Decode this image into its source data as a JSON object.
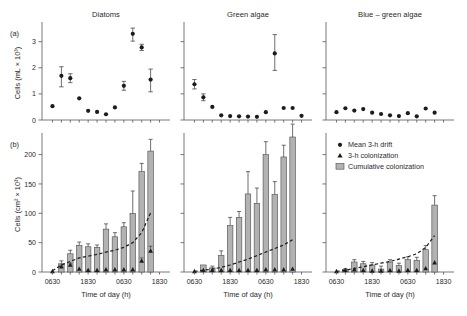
{
  "figure": {
    "panel_a_label": "(a)",
    "panel_b_label": "(b)",
    "xlabel": "Time of day (h)",
    "ylabel_a": "Cells (mL × 10³)",
    "ylabel_b": "Cells (cm² × 10³)",
    "xticklabels": [
      "0630",
      "1830",
      "0630",
      "1830"
    ],
    "yticklabels_a": [
      "0",
      "1",
      "2",
      "3"
    ],
    "yticklabels_b": [
      "0",
      "50",
      "100",
      "150",
      "200"
    ],
    "panel_titles": [
      "Diatoms",
      "Green algae",
      "Blue – green algae"
    ],
    "colors": {
      "bar_fill": "#b2b2b2",
      "bar_stroke": "#4a4a4a",
      "marker": "#1c1c1c",
      "axis": "#555555",
      "background": "#ffffff"
    }
  },
  "legend": {
    "items": [
      {
        "marker": "circle",
        "label": "Mean 3-h drift"
      },
      {
        "marker": "triangle",
        "label": "3-h colonization"
      },
      {
        "marker": "bar",
        "label": "Cumulative colonization"
      }
    ]
  },
  "chart_data": [
    {
      "type": "scatter",
      "panel": "a",
      "title": "Diatoms",
      "xlabel": "",
      "ylabel": "Cells (mL × 10³)",
      "ylim": [
        0,
        3.6
      ],
      "yticks": [
        0,
        1,
        2,
        3
      ],
      "xticks": [
        1,
        5,
        9,
        13
      ],
      "xticklabels": [
        "0630",
        "1830",
        "0630",
        "1830"
      ],
      "grid": false,
      "series": [
        {
          "name": "Mean 3-h drift",
          "x": [
            1,
            2,
            3,
            4,
            5,
            6,
            7,
            8,
            9,
            10,
            11,
            12,
            13
          ],
          "values": [
            0.53,
            1.69,
            1.6,
            0.83,
            0.35,
            0.31,
            0.22,
            0.48,
            1.31,
            3.3,
            2.78,
            1.55,
            null
          ],
          "err_low": [
            0.0,
            0.42,
            0.17,
            0.0,
            0.0,
            0.0,
            0.0,
            0.0,
            0.17,
            0.28,
            0.12,
            0.47,
            null
          ],
          "err_high": [
            0.0,
            0.35,
            0.17,
            0.0,
            0.0,
            0.0,
            0.0,
            0.0,
            0.17,
            0.22,
            0.12,
            0.4,
            null
          ]
        }
      ]
    },
    {
      "type": "scatter",
      "panel": "a",
      "title": "Green algae",
      "xlabel": "",
      "ylabel": "",
      "ylim": [
        0,
        3.6
      ],
      "yticks": [
        0,
        1,
        2,
        3
      ],
      "xticks": [
        1,
        5,
        9,
        13
      ],
      "xticklabels": [
        "0630",
        "1830",
        "0630",
        "1830"
      ],
      "grid": false,
      "series": [
        {
          "name": "Mean 3-h drift",
          "x": [
            1,
            2,
            3,
            4,
            5,
            6,
            7,
            8,
            9,
            10,
            11,
            12,
            13
          ],
          "values": [
            1.37,
            0.87,
            0.5,
            0.18,
            0.15,
            0.14,
            0.13,
            0.12,
            0.3,
            2.55,
            0.46,
            0.46,
            0.16
          ],
          "err_low": [
            0.18,
            0.13,
            0.0,
            0.0,
            0.0,
            0.0,
            0.0,
            0.0,
            0.0,
            0.65,
            0.0,
            0.0,
            0.0
          ],
          "err_high": [
            0.18,
            0.13,
            0.0,
            0.0,
            0.0,
            0.0,
            0.0,
            0.0,
            0.0,
            0.72,
            0.0,
            0.0,
            0.0
          ]
        }
      ]
    },
    {
      "type": "scatter",
      "panel": "a",
      "title": "Blue – green algae",
      "xlabel": "",
      "ylabel": "",
      "ylim": [
        0,
        3.6
      ],
      "yticks": [
        0,
        1,
        2,
        3
      ],
      "xticks": [
        1,
        5,
        9,
        13
      ],
      "xticklabels": [
        "0630",
        "1830",
        "0630",
        "1830"
      ],
      "grid": false,
      "series": [
        {
          "name": "Mean 3-h drift",
          "x": [
            1,
            2,
            3,
            4,
            5,
            6,
            7,
            8,
            9,
            10,
            11,
            12,
            13
          ],
          "values": [
            0.3,
            0.45,
            0.36,
            0.42,
            0.28,
            0.23,
            0.18,
            0.15,
            0.26,
            0.14,
            0.44,
            0.28,
            null
          ],
          "err_low": [
            0.0,
            0.0,
            0.0,
            0.0,
            0.0,
            0.0,
            0.0,
            0.0,
            0.0,
            0.0,
            0.0,
            0.0,
            null
          ],
          "err_high": [
            0.0,
            0.0,
            0.0,
            0.0,
            0.0,
            0.0,
            0.0,
            0.0,
            0.0,
            0.0,
            0.0,
            0.0,
            null
          ]
        }
      ]
    },
    {
      "type": "bar",
      "panel": "b",
      "title": "Diatoms",
      "xlabel": "Time of day (h)",
      "ylabel": "Cells (cm² × 10³)",
      "ylim": [
        0,
        230
      ],
      "yticks": [
        0,
        50,
        100,
        150,
        200
      ],
      "xticks": [
        1,
        5,
        9,
        13
      ],
      "xticklabels": [
        "0630",
        "1830",
        "0630",
        "1830"
      ],
      "grid": false,
      "categories": [
        1,
        2,
        3,
        4,
        5,
        6,
        7,
        8,
        9,
        10,
        11,
        12,
        13
      ],
      "series": [
        {
          "name": "Cumulative colonization",
          "values": [
            0,
            14,
            31,
            45,
            43,
            42,
            73,
            60,
            77,
            100,
            171,
            206,
            null
          ],
          "err_high": [
            0,
            5,
            6,
            6,
            5,
            4,
            9,
            7,
            7,
            38,
            14,
            20,
            null
          ]
        },
        {
          "name": "3-h colonization",
          "values": [
            1,
            9,
            12,
            5,
            3,
            3,
            4,
            4,
            4,
            4,
            19,
            36,
            null
          ],
          "err_high": [
            0,
            3,
            3,
            0,
            0,
            0,
            0,
            0,
            0,
            0,
            5,
            8,
            null
          ]
        },
        {
          "name": "Mean 3-h drift",
          "values": [
            2,
            12,
            18,
            24,
            27,
            30,
            34,
            37,
            42,
            50,
            67,
            101,
            null
          ]
        }
      ]
    },
    {
      "type": "bar",
      "panel": "b",
      "title": "Green algae",
      "xlabel": "Time of day (h)",
      "ylabel": "",
      "ylim": [
        0,
        230
      ],
      "yticks": [
        0,
        50,
        100,
        150,
        200
      ],
      "xticks": [
        1,
        5,
        9,
        13
      ],
      "xticklabels": [
        "0630",
        "1830",
        "0630",
        "1830"
      ],
      "grid": false,
      "categories": [
        1,
        2,
        3,
        4,
        5,
        6,
        7,
        8,
        9,
        10,
        11,
        12,
        13
      ],
      "series": [
        {
          "name": "Cumulative colonization",
          "values": [
            0,
            12,
            7,
            28,
            79,
            93,
            133,
            117,
            200,
            132,
            196,
            230,
            null
          ],
          "err_high": [
            0,
            0,
            3,
            8,
            14,
            10,
            38,
            26,
            22,
            22,
            20,
            22,
            null
          ]
        },
        {
          "name": "3-h colonization",
          "values": [
            1,
            3,
            3,
            3,
            3,
            3,
            3,
            3,
            4,
            4,
            4,
            5,
            null
          ]
        },
        {
          "name": "Mean 3-h drift",
          "values": [
            1,
            3,
            5,
            8,
            12,
            17,
            22,
            28,
            34,
            40,
            46,
            55,
            null
          ]
        }
      ]
    },
    {
      "type": "bar",
      "panel": "b",
      "title": "Blue – green algae",
      "xlabel": "Time of day (h)",
      "ylabel": "",
      "ylim": [
        0,
        230
      ],
      "yticks": [
        0,
        50,
        100,
        150,
        200
      ],
      "xticks": [
        1,
        5,
        9,
        13
      ],
      "xticklabels": [
        "0630",
        "1830",
        "0630",
        "1830"
      ],
      "grid": false,
      "categories": [
        1,
        2,
        3,
        4,
        5,
        6,
        7,
        8,
        9,
        10,
        11,
        12,
        13
      ],
      "series": [
        {
          "name": "Cumulative colonization",
          "values": [
            0,
            4,
            17,
            14,
            12,
            5,
            17,
            11,
            21,
            20,
            38,
            114,
            null
          ],
          "err_high": [
            0,
            2,
            4,
            4,
            4,
            5,
            4,
            4,
            5,
            5,
            7,
            16,
            null
          ]
        },
        {
          "name": "3-h colonization",
          "values": [
            1,
            3,
            4,
            3,
            2,
            2,
            3,
            2,
            3,
            3,
            6,
            16,
            null
          ]
        },
        {
          "name": "Mean 3-h drift",
          "values": [
            1,
            3,
            6,
            9,
            12,
            15,
            18,
            22,
            26,
            31,
            42,
            62,
            null
          ]
        }
      ]
    }
  ]
}
